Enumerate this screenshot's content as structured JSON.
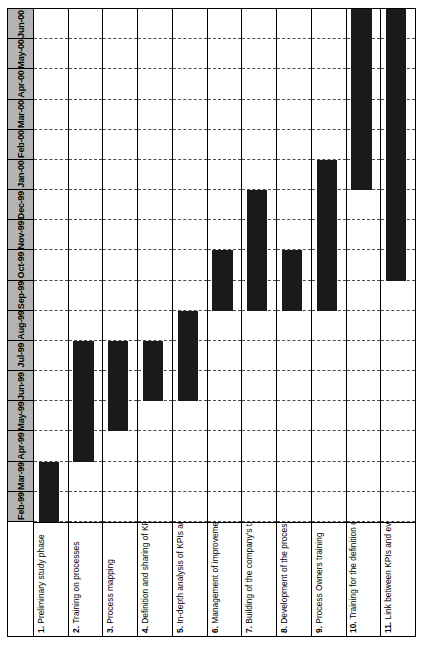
{
  "chart_data": {
    "type": "bar",
    "orientation": "rotated-gantt",
    "title": "",
    "xlabel": "",
    "ylabel": "",
    "grid": true,
    "legend": null,
    "time_axis": {
      "label": "",
      "direction": "bottom-to-top",
      "ticks": [
        "Feb-99",
        "Mar-99",
        "Apr-99",
        "May-99",
        "Jun-99",
        "Jul-99",
        "Aug-99",
        "Sep-99",
        "Oct-99",
        "Nov-99",
        "Dec-99",
        "Jan-00",
        "Feb-00",
        "Mar-00",
        "Apr-00",
        "May-00",
        "Jun-00"
      ]
    },
    "categories": [
      "1. Preliminary study phase",
      "2. Training on processes",
      "3. Process mapping",
      "4. Definition and sharing of KPIs",
      "5. In-depth analysis of KPIs and identification of basic indicators",
      "6. Management of improvement projects",
      "7. Building of the company's tableau de bord",
      "8. Development of the process Intranet",
      "9. Process Owners training",
      "10. Training for the definition of sub-processes and 2nd level KPIs (VBM)",
      "11. Link between KPIs and evaluation of Process Owners' performance"
    ],
    "tasks": [
      {
        "num": "1.",
        "name": "Preliminary study phase",
        "start": "Feb-99",
        "end": "Mar-99",
        "start_index": 0,
        "end_index": 2
      },
      {
        "num": "2.",
        "name": "Training on processes",
        "start": "Apr-99",
        "end": "Jul-99",
        "start_index": 2,
        "end_index": 6
      },
      {
        "num": "3.",
        "name": "Process mapping",
        "start": "May-99",
        "end": "Jul-99",
        "start_index": 3,
        "end_index": 6
      },
      {
        "num": "4.",
        "name": "Definition and sharing of KPIs",
        "start": "Jun-99",
        "end": "Jul-99",
        "start_index": 4,
        "end_index": 6
      },
      {
        "num": "5.",
        "name": "In-depth analysis of KPIs and identification of basic indicators",
        "start": "Jun-99",
        "end": "Aug-99",
        "start_index": 4,
        "end_index": 7
      },
      {
        "num": "6.",
        "name": "Management of improvement projects",
        "start": "Sep-99",
        "end": "Oct-99",
        "start_index": 7,
        "end_index": 9
      },
      {
        "num": "7.",
        "name": "Building of the company's tableau de bord",
        "start": "Sep-99",
        "end": "Dec-99",
        "start_index": 7,
        "end_index": 11
      },
      {
        "num": "8.",
        "name": "Development of the process Intranet",
        "start": "Sep-99",
        "end": "Oct-99",
        "start_index": 7,
        "end_index": 9
      },
      {
        "num": "9.",
        "name": "Process Owners training",
        "start": "Sep-99",
        "end": "Jan-00",
        "start_index": 7,
        "end_index": 12
      },
      {
        "num": "10.",
        "name": "Training for the definition of sub-processes and 2nd level KPIs (VBM)",
        "start": "Jan-00",
        "end": "Jun-00",
        "start_index": 11,
        "end_index": 17
      },
      {
        "num": "11.",
        "name": "Link between KPIs and evaluation of Process Owners' performance",
        "start": "Oct-99",
        "end": "Jun-00",
        "start_index": 8,
        "end_index": 17
      }
    ],
    "colors": {
      "bar": "#1a1a1a",
      "header": "#b4b4b4",
      "grid": "#4d4d4d",
      "frame": "#000000",
      "background": "#ffffff"
    }
  }
}
